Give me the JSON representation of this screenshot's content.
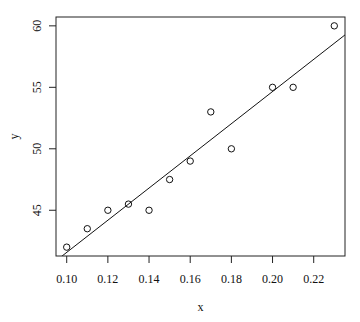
{
  "chart_data": {
    "type": "scatter",
    "title": "",
    "xlabel": "x",
    "ylabel": "y",
    "xlim": [
      0.0948,
      0.2352
    ],
    "ylim": [
      41.28,
      60.72
    ],
    "grid": false,
    "legend": null,
    "x_ticks": [
      0.1,
      0.12,
      0.14,
      0.16,
      0.18,
      0.2,
      0.22
    ],
    "x_tick_labels": [
      "0.10",
      "0.12",
      "0.14",
      "0.16",
      "0.18",
      "0.20",
      "0.22"
    ],
    "y_ticks": [
      45,
      50,
      55,
      60
    ],
    "y_tick_labels": [
      "45",
      "50",
      "55",
      "60"
    ],
    "series": [
      {
        "name": "observations",
        "marker": "open-circle",
        "x": [
          0.1,
          0.11,
          0.12,
          0.13,
          0.14,
          0.15,
          0.16,
          0.17,
          0.18,
          0.2,
          0.21,
          0.23
        ],
        "y": [
          42.0,
          43.5,
          45.0,
          45.5,
          45.0,
          47.5,
          49.0,
          53.0,
          50.0,
          55.0,
          55.0,
          60.0
        ]
      }
    ],
    "fit_line": {
      "type": "linear",
      "intercept": 28.49,
      "slope": 130.84
    }
  },
  "colors": {
    "ink": "#111111",
    "background": "#ffffff"
  }
}
